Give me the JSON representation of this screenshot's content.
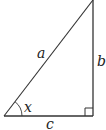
{
  "diagram": {
    "type": "right-triangle",
    "stroke_color": "#333333",
    "labels": {
      "hypotenuse": "a",
      "vertical_leg": "b",
      "horizontal_leg": "c",
      "angle": "x"
    },
    "right_angle_marker": true
  }
}
